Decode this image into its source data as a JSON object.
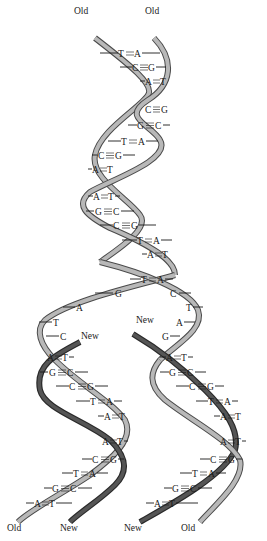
{
  "diagram": {
    "type": "DNA replication fork",
    "colors": {
      "old_strand_fill": "#b8b8b8",
      "old_strand_edge": "#4a4a4a",
      "new_strand_fill": "#555555",
      "new_strand_edge": "#2a2a2a",
      "text": "#1a1a1a"
    },
    "top_labels": {
      "left": "Old",
      "right": "Old"
    },
    "parental_pairs": [
      {
        "l": "T",
        "r": "A",
        "bond": "double"
      },
      {
        "l": "C",
        "r": "G",
        "bond": "triple"
      },
      {
        "l": "A",
        "r": "T",
        "bond": "double"
      },
      {
        "l": "C",
        "r": "G",
        "bond": "triple"
      },
      {
        "l": "G",
        "r": "C",
        "bond": "triple"
      },
      {
        "l": "T",
        "r": "A",
        "bond": "double"
      },
      {
        "l": "C",
        "r": "G",
        "bond": "triple"
      },
      {
        "l": "A",
        "r": "T",
        "bond": "double"
      },
      {
        "l": "A",
        "r": "T",
        "bond": "double"
      },
      {
        "l": "G",
        "r": "C",
        "bond": "triple"
      },
      {
        "l": "C",
        "r": "G",
        "bond": "triple"
      },
      {
        "l": "T",
        "r": "A",
        "bond": "double"
      },
      {
        "l": "A",
        "r": "T",
        "bond": "double"
      },
      {
        "l": "T",
        "r": "A",
        "bond": "double"
      }
    ],
    "fork_unpaired": {
      "left_strand": [
        "G",
        "A",
        "T",
        "C"
      ],
      "right_strand": [
        "C",
        "T",
        "A",
        "G"
      ]
    },
    "fork_labels": {
      "left_new": "New",
      "right_new": "New"
    },
    "daughter_left_pairs": [
      {
        "l": "A",
        "r": "T",
        "bond": "double"
      },
      {
        "l": "G",
        "r": "C",
        "bond": "triple"
      },
      {
        "l": "C",
        "r": "G",
        "bond": "triple"
      },
      {
        "l": "T",
        "r": "A",
        "bond": "double"
      },
      {
        "l": "A",
        "r": "T",
        "bond": "double"
      },
      {
        "l": "A",
        "r": "T",
        "bond": "double"
      },
      {
        "l": "C",
        "r": "G",
        "bond": "triple"
      },
      {
        "l": "T",
        "r": "A",
        "bond": "double"
      },
      {
        "l": "G",
        "r": "C",
        "bond": "triple"
      },
      {
        "l": "A",
        "r": "T",
        "bond": "double"
      }
    ],
    "daughter_right_pairs": [
      {
        "l": "A",
        "r": "T",
        "bond": "double"
      },
      {
        "l": "G",
        "r": "C",
        "bond": "triple"
      },
      {
        "l": "C",
        "r": "G",
        "bond": "triple"
      },
      {
        "l": "T",
        "r": "A",
        "bond": "double"
      },
      {
        "l": "A",
        "r": "T",
        "bond": "double"
      },
      {
        "l": "A",
        "r": "T",
        "bond": "double"
      },
      {
        "l": "C",
        "r": "G",
        "bond": "triple"
      },
      {
        "l": "T",
        "r": "A",
        "bond": "double"
      },
      {
        "l": "G",
        "r": "C",
        "bond": "triple"
      },
      {
        "l": "A",
        "r": "T",
        "bond": "double"
      }
    ],
    "bottom_labels": {
      "left_old": "Old",
      "left_new": "New",
      "right_new": "New",
      "right_old": "Old"
    }
  }
}
